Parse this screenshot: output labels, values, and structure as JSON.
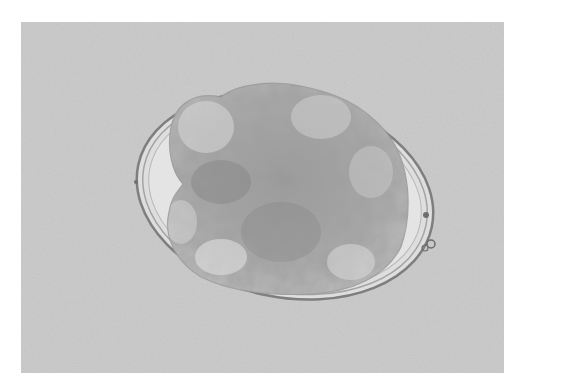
{
  "image": {
    "subject": "microscope image of oval egg with multicellular embryo inside",
    "style": "grayscale brightfield micrograph",
    "colors": {
      "background": "#c8c8c8",
      "shell": "#8a8a8a",
      "inner_clear_space": "#e2e2e2",
      "embryo_dark": "#8c8c8c",
      "embryo_light": "#d6d6d6",
      "border": "#ffffff"
    }
  }
}
